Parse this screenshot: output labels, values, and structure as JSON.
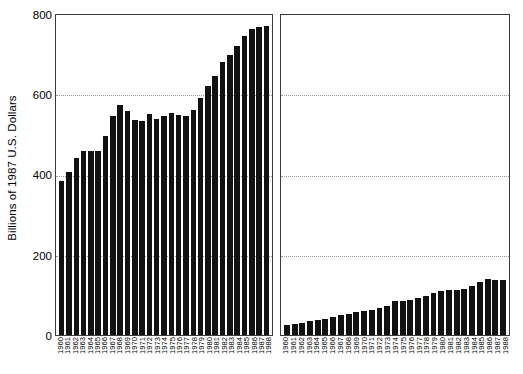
{
  "chart_data": [
    {
      "type": "bar",
      "panel": "left",
      "title": "",
      "xlabel": "",
      "ylabel": "Billions of 1987 U.S. Dollars",
      "ylim": [
        0,
        800
      ],
      "yticks": [
        0,
        200,
        400,
        600,
        800
      ],
      "gridlines": true,
      "legend": "none",
      "categories": [
        "1960",
        "1961",
        "1962",
        "1963",
        "1964",
        "1965",
        "1966",
        "1967",
        "1968",
        "1969",
        "1970",
        "1971",
        "1972",
        "1973",
        "1974",
        "1975",
        "1976",
        "1977",
        "1978",
        "1979",
        "1980",
        "1981",
        "1982",
        "1983",
        "1984",
        "1985",
        "1986",
        "1987",
        "1988"
      ],
      "values": [
        385,
        408,
        443,
        460,
        461,
        459,
        498,
        547,
        574,
        561,
        538,
        535,
        552,
        541,
        548,
        554,
        549,
        548,
        563,
        593,
        622,
        648,
        683,
        700,
        722,
        748,
        766,
        770,
        773
      ]
    },
    {
      "type": "bar",
      "panel": "right",
      "title": "",
      "xlabel": "",
      "ylabel": "",
      "ylim": [
        0,
        800
      ],
      "yticks": [
        0,
        200,
        400,
        600,
        800
      ],
      "gridlines": true,
      "legend": "none",
      "categories": [
        "1960",
        "1961",
        "1962",
        "1963",
        "1964",
        "1965",
        "1966",
        "1967",
        "1968",
        "1969",
        "1970",
        "1971",
        "1972",
        "1973",
        "1974",
        "1975",
        "1976",
        "1977",
        "1978",
        "1979",
        "1980",
        "1981",
        "1982",
        "1983",
        "1984",
        "1985",
        "1986",
        "1987",
        "1988"
      ],
      "values": [
        25,
        27,
        31,
        34,
        37,
        41,
        44,
        49,
        53,
        57,
        60,
        63,
        68,
        73,
        84,
        84,
        88,
        93,
        97,
        104,
        110,
        112,
        113,
        116,
        122,
        132,
        141,
        138,
        138
      ]
    }
  ],
  "axis": {
    "ylabel": "Billions of 1987 U.S. Dollars",
    "yticks": [
      "800",
      "600",
      "400",
      "200",
      "0"
    ]
  }
}
